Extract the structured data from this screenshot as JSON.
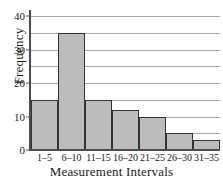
{
  "chart_data": {
    "type": "bar",
    "title": "",
    "xlabel": "Measurement Intervals",
    "ylabel": "Frequency",
    "categories": [
      "1–5",
      "6–10",
      "11–15",
      "16–20",
      "21–25",
      "26–30",
      "31–35"
    ],
    "values": [
      15,
      35,
      15,
      12,
      10,
      5,
      3
    ],
    "ylim": [
      0,
      40
    ],
    "ytick_labels": [
      "0",
      "10",
      "20",
      "30",
      "40"
    ],
    "ytick_values": [
      0,
      10,
      20,
      30,
      40
    ],
    "gridline_values": [
      5,
      10,
      15,
      20,
      25,
      30,
      35,
      40
    ],
    "grid": true,
    "legend": "none",
    "colors": {
      "bar_fill": "#bcbcbc",
      "bar_edge": "#333333",
      "gridline": "#a9a9a9",
      "axis": "#4d4d4d",
      "text": "#1a1a1a",
      "background": "#ffffff"
    }
  }
}
